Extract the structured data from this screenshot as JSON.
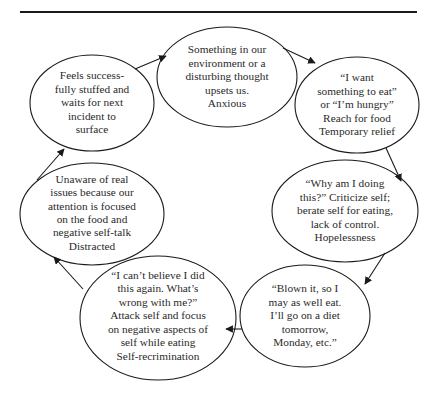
{
  "diagram": {
    "type": "cycle",
    "colors": {
      "stroke": "#1a1a1a",
      "text": "#2a2a2a",
      "background": "#ffffff"
    },
    "nodes": [
      {
        "id": "trigger",
        "text": "Something in our\nenvironment or a\ndisturbing thought\nupsets us.\nAnxious"
      },
      {
        "id": "urge",
        "text": "“I want\nsomething to eat”\nor “I’m hungry”\nReach for food\nTemporary relief"
      },
      {
        "id": "criticize",
        "text": "“Why am I doing\nthis?”  Criticize self;\nberate self for eating,\nlack of control.\nHopelessness"
      },
      {
        "id": "blown-it",
        "text": "“Blown it, so I\nmay as well eat.\nI’ll go on a diet\ntomorrow,\nMonday, etc.”"
      },
      {
        "id": "attack-self",
        "text": "“I can’t believe I did\nthis again. What’s\nwrong with me?”\nAttack self and focus\non negative aspects of\nself while eating\nSelf-recrimination"
      },
      {
        "id": "distracted",
        "text": "Unaware of real\nissues because our\nattention is focused\non the food and\nnegative self-talk\nDistracted"
      },
      {
        "id": "stuffed",
        "text": "Feels success-\nfully stuffed and\nwaits for next\nincident to\nsurface"
      }
    ],
    "edges": [
      {
        "from": "trigger",
        "to": "urge"
      },
      {
        "from": "urge",
        "to": "criticize"
      },
      {
        "from": "criticize",
        "to": "blown-it"
      },
      {
        "from": "blown-it",
        "to": "attack-self"
      },
      {
        "from": "attack-self",
        "to": "distracted"
      },
      {
        "from": "distracted",
        "to": "stuffed"
      },
      {
        "from": "stuffed",
        "to": "trigger"
      }
    ]
  }
}
